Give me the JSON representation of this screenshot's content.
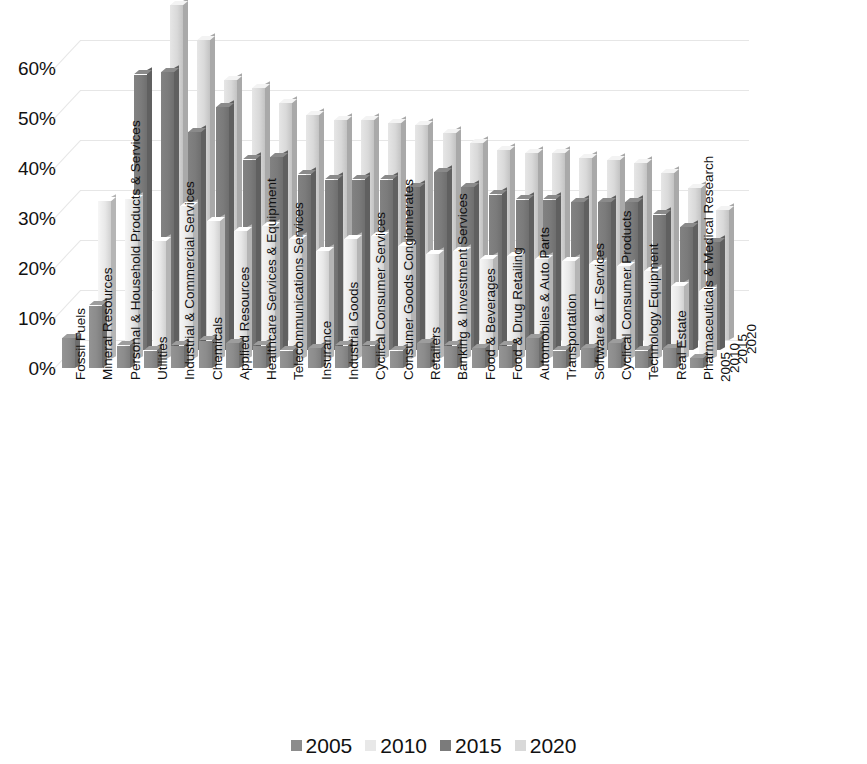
{
  "chart_data": {
    "type": "bar",
    "title": "",
    "subtitle": "",
    "xlabel": "",
    "ylabel": "",
    "zlabel": "",
    "ylim": [
      0,
      70
    ],
    "ytick_labels": [
      "0%",
      "10%",
      "20%",
      "30%",
      "40%",
      "50%",
      "60%"
    ],
    "ytick_values": [
      0,
      10,
      20,
      30,
      40,
      50,
      60
    ],
    "grid": true,
    "legend_position": "bottom",
    "projection": "3d",
    "categories": [
      "Fossil Fuels",
      "Mineral Resources",
      "Personal & Household Products & Services",
      "Utilities",
      "Industrial & Commercial Services",
      "Chemicals",
      "Applied Resources",
      "Healthcare Services & Equipment",
      "Telecommunications Services",
      "Insurance",
      "Industrial Goods",
      "Cyclical Consumer Services",
      "Consumer Goods Conglomerates",
      "Retailers",
      "Banking & Investment Services",
      "Food & Beverages",
      "Food & Drug Retailing",
      "Automobiles & Auto Parts",
      "Transportation",
      "Software & IT Services",
      "Cyclical Consumer Products",
      "Technology Equipment",
      "Real Estate",
      "Pharmaceuticals & Medical Research"
    ],
    "series": [
      {
        "name": "2005",
        "color": "#8c8c8c",
        "values": [
          6,
          12.5,
          4.5,
          3.5,
          4.5,
          5.5,
          5,
          4.5,
          3.5,
          4,
          4.5,
          4.5,
          3.5,
          5,
          4.5,
          4,
          4.5,
          6,
          3.5,
          4,
          5,
          3.5,
          4,
          2
        ]
      },
      {
        "name": "2010",
        "color": "#e8e8e8",
        "values": [
          0,
          31.5,
          32,
          23.5,
          30.5,
          27.5,
          25.5,
          26.5,
          24,
          21.5,
          24,
          24.5,
          22.5,
          21,
          21.5,
          20,
          20.5,
          20,
          19.5,
          19,
          18.5,
          17.5,
          14.5,
          13.5
        ]
      },
      {
        "name": "2015",
        "color": "#7b7b7b",
        "values": [
          0,
          0,
          55,
          55.5,
          43.5,
          48.5,
          38,
          38.5,
          35,
          34,
          34,
          34,
          32.5,
          35.5,
          32.5,
          31,
          30,
          30,
          29.5,
          29.5,
          29.5,
          27,
          24.5,
          21.5
        ]
      },
      {
        "name": "2020",
        "color": "#d9d9d9",
        "values": [
          0,
          0,
          0,
          67,
          60,
          52,
          50.5,
          47.5,
          45,
          44,
          44,
          43.5,
          43,
          41.5,
          39.5,
          38,
          37.5,
          37.5,
          36.5,
          36,
          35.5,
          33.5,
          30.5,
          26
        ]
      }
    ],
    "series_axis_labels": [
      "2005",
      "2010",
      "2015",
      "2020"
    ]
  },
  "legend": {
    "items": [
      {
        "label": "2005",
        "color": "#8c8c8c"
      },
      {
        "label": "2010",
        "color": "#e8e8e8"
      },
      {
        "label": "2015",
        "color": "#7b7b7b"
      },
      {
        "label": "2020",
        "color": "#d9d9d9"
      }
    ]
  }
}
